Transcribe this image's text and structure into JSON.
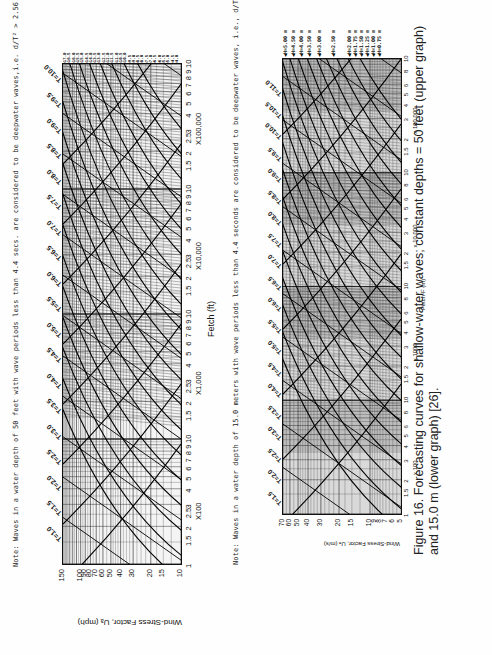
{
  "page": {
    "orientation": "rotated-90-ccw"
  },
  "upper_graph": {
    "note": "Note: Waves in a water depth of 50 feet with wave periods less than 4.4 secs. are considered to be deepwater waves,i.e. d/T² > 2.56.",
    "y_axis_title": "Wind-Stress Factor, Uₐ (mph)",
    "y_ticks": [
      "150",
      "100",
      "90",
      "80",
      "70",
      "60",
      "50",
      "40",
      "30",
      "20",
      "15",
      "10"
    ],
    "x_axis_title": "Fetch (ft)",
    "x_decades": [
      {
        "ticks": [
          "1",
          "1.5",
          "2",
          "2.5",
          "3",
          "4",
          "5",
          "6",
          "7",
          "8",
          "9",
          "10"
        ],
        "multiplier": "X100"
      },
      {
        "ticks": [
          "1.5",
          "2",
          "2.5",
          "3",
          "4",
          "5",
          "6",
          "7",
          "8",
          "9",
          "10"
        ],
        "multiplier": "X1,000"
      },
      {
        "ticks": [
          "1.5",
          "2",
          "2.5",
          "3",
          "4",
          "5",
          "6",
          "7",
          "8",
          "9",
          "10"
        ],
        "multiplier": "X10,000"
      },
      {
        "ticks": [
          "1.5",
          "2",
          "2.5",
          "3",
          "4",
          "5",
          "6",
          "7",
          "8",
          "9",
          "10"
        ],
        "multiplier": "X100,000"
      }
    ],
    "period_labels": [
      "T=1.0",
      "T=1.5",
      "T=2.0",
      "T=2.5",
      "T=3.0",
      "T=3.5",
      "T=4.0",
      "T=4.5",
      "T=5.0",
      "T=5.5",
      "T=6.0",
      "T=6.5",
      "T=7.0",
      "T=7.5",
      "T=8.0",
      "T=8.5",
      "T=9.0",
      "T=9.5",
      "T=10.0"
    ],
    "height_labels": [
      "H=17.0",
      "H=16.5",
      "H=16.0",
      "H=15.5",
      "H=15.0",
      "H=14.5",
      "H=14.0",
      "H=13.5",
      "H=13.0",
      "H=12.5",
      "H=12.0",
      "H=11.5",
      "H=11.0",
      "H=10.5",
      "H=10.0",
      "H=9.5",
      "H=9.0",
      "H=8.5",
      "H=8.0",
      "H=7.5",
      "H=7.0",
      "H=6.5",
      "H=6.0",
      "H=5.5",
      "H=5.0",
      "H=4.5",
      "H=4.0"
    ],
    "inline_labels": [
      "T=0.5 sec",
      "H=1 ft",
      "H=0.5 ft",
      "H=1.0 ft",
      "T=1.0",
      "H=2.0",
      "H=3.0",
      "H=3.5",
      "H=7.5"
    ]
  },
  "lower_graph": {
    "note": "Note: Waves in a water depth of 15.0 meters with wave periods less than 4.4 seconds are considered to be deepwater waves, i.e., d/T² > 0.78.",
    "y_axis_title": "Wind-Stress Factor, Uₐ (m/s)",
    "y_ticks": [
      "70",
      "60",
      "50",
      "40",
      "30",
      "20",
      "15",
      "10",
      "9",
      "8",
      "7",
      "6",
      "5"
    ],
    "x_axis_title": "Fetch-F (m)",
    "x_decades": [
      {
        "ticks": [
          "1",
          "1.5",
          "2",
          "3",
          "4",
          "5",
          "6",
          "8",
          "10"
        ],
        "multiplier": "x 100"
      },
      {
        "ticks": [
          "1.5",
          "2",
          "3",
          "4",
          "5",
          "6",
          "8",
          "10"
        ],
        "multiplier": "x 1000"
      },
      {
        "ticks": [
          "1.5",
          "2",
          "3",
          "4",
          "5",
          "6",
          "8",
          "10"
        ],
        "multiplier": "x 10 000"
      },
      {
        "ticks": [
          "1.5",
          "2",
          "3",
          "4",
          "5",
          "6",
          "8",
          "10"
        ],
        "multiplier": "x 100 000"
      }
    ],
    "period_labels": [
      "T=1.5",
      "T=2.0",
      "T=2.5",
      "T=3.0",
      "T=3.5",
      "T=4.0",
      "T=4.5",
      "T=5.0",
      "T=5.5",
      "T=6.0",
      "T=6.5",
      "T=7.0",
      "T=7.5",
      "T=8.0",
      "T=8.5",
      "T=9.0",
      "T=9.5",
      "T=10.0",
      "T=10.5",
      "T=11.0"
    ],
    "height_labels": [
      "H=5.00 m",
      "H=4.50 m",
      "H=4.00 m",
      "H=3.50 m",
      "H=3.00 m",
      "H=2.50 m",
      "H=2.00 m",
      "H=1.75 m",
      "H=1.50 m",
      "H=1.25 m",
      "H=1.00 m",
      "H=0.75 m"
    ],
    "inline_labels": [
      "T=1.0",
      "H=0.25 m",
      "H=0.5 m"
    ]
  },
  "caption": {
    "label": "Figure 16.",
    "text": "Forecasting curves for shallow-water waves; constant depths = 50 feet (upper graph) and 15.0 m (lower graph) [26]."
  },
  "chart_data": [
    {
      "type": "line",
      "title": "Shallow-water wave forecasting curves, depth = 50 ft",
      "xlabel": "Fetch (ft)",
      "ylabel": "Wind-Stress Factor, UA (mph)",
      "x_scale": "log",
      "xlim": [
        100,
        1000000
      ],
      "y_scale": "log",
      "ylim": [
        10,
        150
      ],
      "y_ticks": [
        10,
        15,
        20,
        30,
        40,
        50,
        60,
        70,
        80,
        90,
        100,
        150
      ],
      "series": [
        {
          "name": "Wave period T (s) isolines",
          "values": [
            1.0,
            1.5,
            2.0,
            2.5,
            3.0,
            3.5,
            4.0,
            4.5,
            5.0,
            5.5,
            6.0,
            6.5,
            7.0,
            7.5,
            8.0,
            8.5,
            9.0,
            9.5,
            10.0
          ]
        },
        {
          "name": "Wave height H (ft) isolines",
          "values": [
            0.5,
            1.0,
            2.0,
            3.0,
            3.5,
            4.0,
            4.5,
            5.0,
            5.5,
            6.0,
            6.5,
            7.0,
            7.5,
            8.0,
            8.5,
            9.0,
            9.5,
            10.0,
            10.5,
            11.0,
            11.5,
            12.0,
            12.5,
            13.0,
            13.5,
            14.0,
            14.5,
            15.0,
            15.5,
            16.0,
            16.5,
            17.0
          ]
        }
      ],
      "grid": true,
      "annotations": [
        "Waves with periods less than 4.4 s are deepwater waves, d/T^2 > 2.56"
      ]
    },
    {
      "type": "line",
      "title": "Shallow-water wave forecasting curves, depth = 15.0 m",
      "xlabel": "Fetch-F (m)",
      "ylabel": "Wind-Stress Factor, UA (m/s)",
      "x_scale": "log",
      "xlim": [
        100,
        1000000
      ],
      "y_scale": "log",
      "ylim": [
        5,
        70
      ],
      "y_ticks": [
        5,
        6,
        7,
        8,
        9,
        10,
        15,
        20,
        30,
        40,
        50,
        60,
        70
      ],
      "series": [
        {
          "name": "Wave period T (s) isolines",
          "values": [
            1.0,
            1.5,
            2.0,
            2.5,
            3.0,
            3.5,
            4.0,
            4.5,
            5.0,
            5.5,
            6.0,
            6.5,
            7.0,
            7.5,
            8.0,
            8.5,
            9.0,
            9.5,
            10.0,
            10.5,
            11.0
          ]
        },
        {
          "name": "Wave height H (m) isolines",
          "values": [
            0.25,
            0.5,
            0.75,
            1.0,
            1.25,
            1.5,
            1.75,
            2.0,
            2.5,
            3.0,
            3.5,
            4.0,
            4.5,
            5.0
          ]
        }
      ],
      "grid": true,
      "annotations": [
        "Waves with periods less than 4.4 s are deepwater waves, d/T^2 > 0.78"
      ]
    }
  ]
}
